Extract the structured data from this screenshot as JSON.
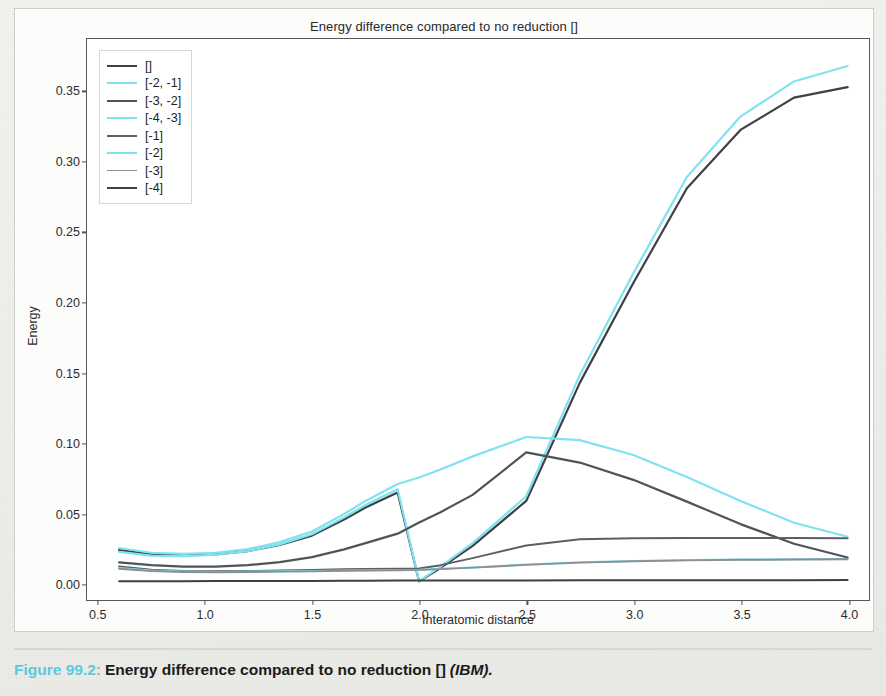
{
  "figure": {
    "caption_number": "Figure 99.2:",
    "caption_text": "Energy difference compared to no reduction []",
    "caption_source": "(IBM).",
    "figure_number_color": "#5ec8e0"
  },
  "chart_data": {
    "type": "line",
    "title": "Energy difference compared to no reduction []",
    "xlabel": "Interatomic distance",
    "ylabel": "Energy",
    "xlim": [
      0.45,
      4.1
    ],
    "ylim": [
      -0.012,
      0.3872
    ],
    "xticks": [
      0.5,
      1.0,
      1.5,
      2.0,
      2.5,
      3.0,
      3.5,
      4.0
    ],
    "xtick_labels": [
      "0.5",
      "1.0",
      "1.5",
      "2.0",
      "2.5",
      "3.0",
      "3.5",
      "4.0"
    ],
    "yticks": [
      0.0,
      0.05,
      0.1,
      0.15,
      0.2,
      0.25,
      0.3,
      0.35
    ],
    "ytick_labels": [
      "0.00",
      "0.05",
      "0.10",
      "0.15",
      "0.20",
      "0.25",
      "0.30",
      "0.35"
    ],
    "grid": false,
    "legend_position": "upper left",
    "x": [
      0.6,
      0.75,
      0.9,
      1.05,
      1.2,
      1.35,
      1.5,
      1.65,
      1.75,
      1.9,
      2.0,
      2.1,
      2.25,
      2.5,
      2.75,
      3.0,
      3.25,
      3.5,
      3.75,
      4.0
    ],
    "series": [
      {
        "name": "[]",
        "color": "#3f3f44",
        "width": 2.2,
        "values": [
          0.0235,
          0.0205,
          0.0198,
          0.0205,
          0.0228,
          0.0272,
          0.0338,
          0.0452,
          0.0538,
          0.0645,
          0.0012,
          0.0108,
          0.0265,
          0.0585,
          0.1425,
          0.2135,
          0.281,
          0.3225,
          0.3455,
          0.353
        ]
      },
      {
        "name": "[-2, -1]",
        "color": "#7fe3ef",
        "width": 2.2,
        "values": [
          0.0222,
          0.0196,
          0.0192,
          0.0202,
          0.0228,
          0.0276,
          0.0348,
          0.0468,
          0.0556,
          0.0668,
          0.0014,
          0.0118,
          0.0285,
          0.0618,
          0.148,
          0.2205,
          0.289,
          0.332,
          0.357,
          0.368
        ]
      },
      {
        "name": "[-3, -2]",
        "color": "#4d5558",
        "width": 2.2,
        "values": [
          0.0148,
          0.0128,
          0.0118,
          0.0118,
          0.0128,
          0.015,
          0.0185,
          0.024,
          0.0285,
          0.0352,
          0.0432,
          0.0505,
          0.0628,
          0.093,
          0.0858,
          0.0735,
          0.058,
          0.042,
          0.028,
          0.0182
        ]
      },
      {
        "name": "[-4, -3]",
        "color": "#7fe3ef",
        "width": 2.2,
        "values": [
          0.025,
          0.0216,
          0.0208,
          0.0216,
          0.0242,
          0.0292,
          0.0368,
          0.0492,
          0.0585,
          0.0705,
          0.0752,
          0.0808,
          0.0902,
          0.104,
          0.1018,
          0.0912,
          0.0755,
          0.0585,
          0.043,
          0.033
        ]
      },
      {
        "name": "[-1]",
        "color": "#5a6063",
        "width": 2.0,
        "values": [
          0.0118,
          0.0096,
          0.0086,
          0.0084,
          0.0086,
          0.009,
          0.0094,
          0.0098,
          0.01,
          0.0102,
          0.0104,
          0.0128,
          0.0178,
          0.0268,
          0.0312,
          0.032,
          0.0322,
          0.0322,
          0.0322,
          0.032
        ]
      },
      {
        "name": "[-2]",
        "color": "#7fe3ef",
        "width": 2.0,
        "values": [
          0.0108,
          0.009,
          0.0082,
          0.008,
          0.0082,
          0.0084,
          0.0086,
          0.009,
          0.0092,
          0.0094,
          0.0096,
          0.0102,
          0.0112,
          0.0132,
          0.0148,
          0.0158,
          0.0164,
          0.0168,
          0.017,
          0.0172
        ]
      },
      {
        "name": "[-3]",
        "color": "#8a8f92",
        "width": 1.9,
        "values": [
          0.0102,
          0.0086,
          0.0079,
          0.0077,
          0.0079,
          0.0082,
          0.0084,
          0.0088,
          0.009,
          0.0092,
          0.0094,
          0.01,
          0.011,
          0.013,
          0.0146,
          0.0156,
          0.0162,
          0.0166,
          0.0168,
          0.017
        ]
      },
      {
        "name": "[-4]",
        "color": "#3f3f44",
        "width": 2.0,
        "values": [
          0.0014,
          0.0014,
          0.0014,
          0.0015,
          0.0015,
          0.0016,
          0.0016,
          0.0017,
          0.0017,
          0.0018,
          0.0018,
          0.0018,
          0.0019,
          0.0019,
          0.002,
          0.002,
          0.0021,
          0.0021,
          0.0021,
          0.0022
        ]
      }
    ]
  }
}
